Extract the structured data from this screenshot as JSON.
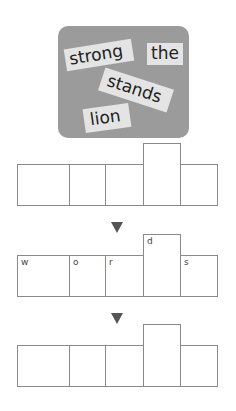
{
  "word_board": {
    "cards": [
      {
        "id": "strong",
        "text": "strong"
      },
      {
        "id": "the",
        "text": "the"
      },
      {
        "id": "stands",
        "text": "stands"
      },
      {
        "id": "lion",
        "text": "lion"
      }
    ],
    "background_color": "#9b9b9b"
  },
  "shape_rows": [
    {
      "label": "shape-row-1",
      "letters": [
        "",
        "",
        "",
        "",
        ""
      ]
    },
    {
      "label": "shape-row-2",
      "letters": [
        "w",
        "o",
        "r",
        "d",
        "s"
      ]
    },
    {
      "label": "shape-row-3",
      "letters": [
        "",
        "",
        "",
        "",
        ""
      ]
    }
  ],
  "arrows": [
    "down-arrow",
    "down-arrow"
  ]
}
